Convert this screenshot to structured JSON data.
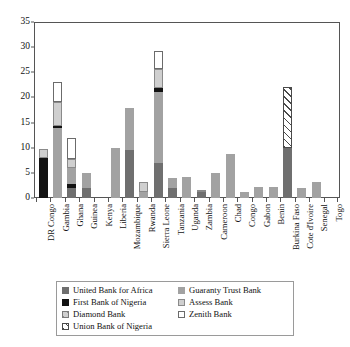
{
  "chart_data": {
    "type": "bar",
    "subtype": "stacked-bar",
    "title": "",
    "xlabel": "",
    "ylabel": "",
    "ylim": [
      0,
      35
    ],
    "yticks": [
      0,
      5,
      10,
      15,
      20,
      25,
      30,
      35
    ],
    "grid": false,
    "legend_position": "bottom",
    "categories": [
      "DR Congo",
      "Gambia",
      "Ghana",
      "Guinea",
      "Kenya",
      "Liberia",
      "Mozambique",
      "Rwanda",
      "Sierra Leone",
      "Tanzania",
      "Uganda",
      "Zambia",
      "Cameroon",
      "Chad",
      "Congo",
      "Gabon",
      "Benin",
      "Burkina Faso",
      "Cote d'Ivoire",
      "Senegal",
      "Togo"
    ],
    "series": [
      {
        "name": "United Bank for Africa",
        "color": "#6f6f6f",
        "values": [
          0,
          0,
          2.0,
          2.0,
          0,
          0,
          9.5,
          0,
          7.0,
          2.0,
          0,
          1.2,
          0,
          0,
          0,
          0,
          0,
          10.0,
          0,
          0,
          0
        ]
      },
      {
        "name": "First Bank of Nigeria",
        "color": "#121212",
        "values": [
          8.0,
          0,
          0.7,
          0,
          0,
          0,
          0,
          0,
          0,
          0,
          0,
          0,
          0,
          0,
          0,
          0,
          0,
          0,
          0,
          0,
          0
        ]
      },
      {
        "name": "Diamond Bank",
        "color": "#d0d0d0",
        "values": [
          0,
          0,
          0,
          0,
          0,
          0,
          0,
          0,
          0,
          0,
          0,
          0,
          0,
          0,
          0,
          0,
          0,
          0,
          0,
          0,
          0
        ]
      },
      {
        "name": "Union Bank of Nigeria",
        "color": "#ffffff",
        "values": [
          0,
          0,
          0,
          0,
          0,
          0,
          0,
          0,
          0,
          0,
          0,
          0,
          0,
          0,
          0,
          0,
          0,
          12.0,
          0,
          0,
          0
        ]
      },
      {
        "name": "Guaranty Trust Bank",
        "color": "#a2a2a2",
        "values": [
          0,
          14.0,
          3.3,
          3.0,
          0,
          10.0,
          8.5,
          1.2,
          14.0,
          2.0,
          4.2,
          0,
          5.0,
          8.8,
          1.2,
          2.2,
          2.2,
          0,
          2.0,
          3.2,
          0
        ]
      },
      {
        "name": "First Bank of Nigeria (black band)",
        "color": "#121212",
        "values": [
          0,
          0.4,
          0,
          0,
          0,
          0,
          0,
          0,
          0.8,
          0,
          0,
          0,
          0,
          0,
          0,
          0,
          0,
          0,
          0,
          0,
          0
        ]
      },
      {
        "name": "Assess Bank",
        "color": "#cfcfcf",
        "values": [
          1.8,
          4.6,
          1.8,
          0,
          0,
          0,
          0,
          2.0,
          3.8,
          0,
          0,
          0.3,
          0,
          0,
          0,
          0,
          0,
          0,
          0,
          0,
          0
        ]
      },
      {
        "name": "Zenith Bank",
        "color": "#ffffff",
        "values": [
          0,
          4.0,
          4.2,
          0,
          0,
          0,
          0,
          0,
          3.6,
          0,
          0,
          0,
          0,
          0,
          0,
          0,
          0,
          0,
          0,
          0,
          0
        ]
      }
    ],
    "bar_totals": [
      9.8,
      23.0,
      12.0,
      5.0,
      0,
      10.0,
      18.0,
      3.2,
      29.2,
      4.0,
      4.2,
      1.5,
      5.0,
      8.8,
      1.2,
      2.2,
      2.2,
      22.0,
      2.0,
      3.2,
      0
    ]
  },
  "axis": {
    "yticks": [
      "0",
      "5",
      "10",
      "15",
      "20",
      "25",
      "30",
      "35"
    ]
  },
  "xaxis": {
    "labels": [
      "DR Congo",
      "Gambia",
      "Ghana",
      "Guinea",
      "Kenya",
      "Liberia",
      "Mozambique",
      "Rwanda",
      "Sierra Leone",
      "Tanzania",
      "Uganda",
      "Zambia",
      "Cameroon",
      "Chad",
      "Congo",
      "Gabon",
      "Benin",
      "Burkina Faso",
      "Cote d'Ivoire",
      "Senegal",
      "Togo"
    ]
  },
  "legend": {
    "items": [
      {
        "label": "United Bank for Africa",
        "swatch": "uba"
      },
      {
        "label": "Guaranty Trust Bank",
        "swatch": "gtb"
      },
      {
        "label": "First Bank of Nigeria",
        "swatch": "fbn"
      },
      {
        "label": "Assess Bank",
        "swatch": "ass"
      },
      {
        "label": "Diamond Bank",
        "swatch": "dia"
      },
      {
        "label": "Zenith Bank",
        "swatch": "zen"
      },
      {
        "label": "Union Bank of Nigeria",
        "swatch": "ubn"
      }
    ]
  }
}
